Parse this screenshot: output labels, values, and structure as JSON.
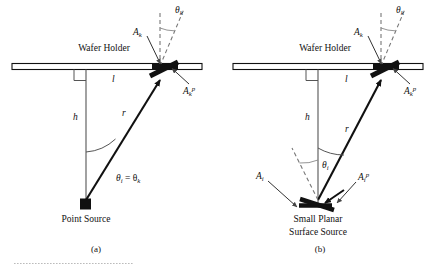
{
  "figure": {
    "type": "scientific-diagram",
    "background_color": "#ffffff",
    "line_color": "#111111",
    "panels": [
      {
        "id": "a",
        "caption": "(a)",
        "labels": {
          "wafer_holder": "Wafer Holder",
          "source": "Point Source",
          "l": "l",
          "h": "h",
          "r": "r",
          "theta_k_top": "θ",
          "theta_k_top_sub": "k",
          "A_k": "A",
          "A_k_sub": "k",
          "A_k_p": "A",
          "A_k_p_sub": "k",
          "A_k_p_sup": "p",
          "angle_equality_theta": "θ",
          "angle_equality_sub_i": "i",
          "angle_equality_eq": " = θ",
          "angle_equality_sub_k": "k"
        }
      },
      {
        "id": "b",
        "caption": "(b)",
        "labels": {
          "wafer_holder": "Wafer Holder",
          "source_line1": "Small Planar",
          "source_line2": "Surface Source",
          "l": "l",
          "h": "h",
          "r": "r",
          "theta_k_top": "θ",
          "theta_k_top_sub": "k",
          "theta_i": "θ",
          "theta_i_sub": "i",
          "A_k": "A",
          "A_k_sub": "k",
          "A_k_p": "A",
          "A_k_p_sub": "k",
          "A_k_p_sup": "p",
          "A_i": "A",
          "A_i_sub": "i",
          "A_i_p": "A",
          "A_i_p_sub": "i",
          "A_i_p_sup": "p"
        }
      }
    ]
  }
}
